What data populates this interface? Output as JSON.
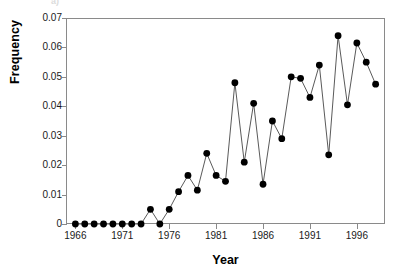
{
  "chart_data": {
    "type": "line",
    "title": "",
    "xlabel": "Year",
    "ylabel": "Frequency",
    "xlim": [
      1965,
      1999
    ],
    "ylim": [
      0,
      0.07
    ],
    "grid": false,
    "legend": null,
    "marker": "filled-circle",
    "x_tick_labels": [
      "1966",
      "1971",
      "1976",
      "1981",
      "1986",
      "1991",
      "1996"
    ],
    "x_tick_values": [
      1966,
      1971,
      1976,
      1981,
      1986,
      1991,
      1996
    ],
    "y_tick_labels": [
      "0",
      "0.01",
      "0.02",
      "0.03",
      "0.04",
      "0.05",
      "0.06",
      "0.07"
    ],
    "y_tick_values": [
      0,
      0.01,
      0.02,
      0.03,
      0.04,
      0.05,
      0.06,
      0.07
    ],
    "x": [
      1966,
      1967,
      1968,
      1969,
      1970,
      1971,
      1972,
      1973,
      1974,
      1975,
      1976,
      1977,
      1978,
      1979,
      1980,
      1981,
      1982,
      1983,
      1984,
      1985,
      1986,
      1987,
      1988,
      1989,
      1990,
      1991,
      1992,
      1993,
      1994,
      1995,
      1996,
      1997,
      1998
    ],
    "values": [
      0,
      0,
      0,
      0,
      0,
      0,
      0,
      0,
      0.005,
      0,
      0.005,
      0.011,
      0.0165,
      0.0115,
      0.024,
      0.0165,
      0.0145,
      0.048,
      0.021,
      0.041,
      0.0135,
      0.035,
      0.029,
      0.05,
      0.0495,
      0.043,
      0.054,
      0.0235,
      0.064,
      0.0405,
      0.0615,
      0.055,
      0.0475
    ],
    "series": [
      {
        "name": "Frequency",
        "color": "#000000",
        "line_color": "#5a5a5a",
        "values": [
          0,
          0,
          0,
          0,
          0,
          0,
          0,
          0,
          0.005,
          0,
          0.005,
          0.011,
          0.0165,
          0.0115,
          0.024,
          0.0165,
          0.0145,
          0.048,
          0.021,
          0.041,
          0.0135,
          0.035,
          0.029,
          0.05,
          0.0495,
          0.043,
          0.054,
          0.0235,
          0.064,
          0.0405,
          0.0615,
          0.055,
          0.0475
        ]
      }
    ]
  },
  "axes": {
    "y_title": "Frequency",
    "x_title": "Year"
  },
  "colors": {
    "frame": "#8a8a8a",
    "marker": "#000000",
    "line": "#5a5a5a",
    "text": "#1a1a1a",
    "background": "#ffffff"
  },
  "top_clipped_glyph": "a)"
}
